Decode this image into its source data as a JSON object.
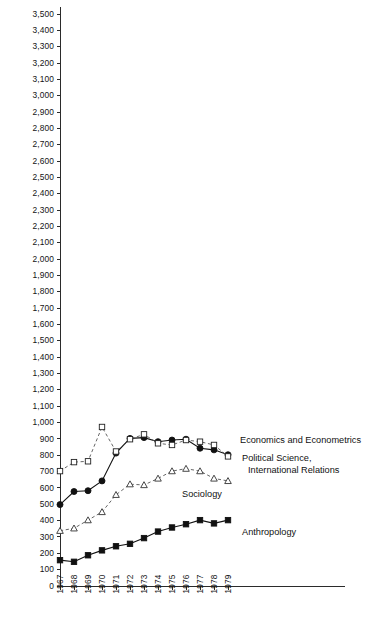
{
  "chart_data": {
    "type": "line",
    "title": "",
    "subtitle": "",
    "xlabel": "",
    "ylabel": "",
    "grid": false,
    "legend_position": "inline-right-annotations",
    "x": [
      1967,
      1968,
      1969,
      1970,
      1971,
      1972,
      1973,
      1974,
      1975,
      1976,
      1977,
      1978,
      1979
    ],
    "xlim": [
      1967,
      1979
    ],
    "ylim": [
      0,
      3500
    ],
    "ytick_labels": [
      "3,500",
      "3,400",
      "3,300",
      "3,200",
      "3,100",
      "3,000",
      "2,900",
      "2,800",
      "2,700",
      "2,600",
      "2,500",
      "2,400",
      "2,300",
      "2,200",
      "2,100",
      "2,000",
      "1,900",
      "1,800",
      "1,700",
      "1,600",
      "1,500",
      "1,400",
      "1,300",
      "1,200",
      "1,100",
      "1,000",
      "900",
      "800",
      "700",
      "600",
      "500",
      "400",
      "300",
      "200",
      "100",
      "0"
    ],
    "ytick_values": [
      3500,
      3400,
      3300,
      3200,
      3100,
      3000,
      2900,
      2800,
      2700,
      2600,
      2500,
      2400,
      2300,
      2200,
      2100,
      2000,
      1900,
      1800,
      1700,
      1600,
      1500,
      1400,
      1300,
      1200,
      1100,
      1000,
      900,
      800,
      700,
      600,
      500,
      400,
      300,
      200,
      100,
      0
    ],
    "xtick_labels": [
      "1967",
      "1968",
      "1969",
      "1970",
      "1971",
      "1972",
      "1973",
      "1974",
      "1975",
      "1976",
      "1977",
      "1978",
      "1979"
    ],
    "series": [
      {
        "name": "Economics and Econometrics",
        "marker": "filled-circle",
        "line": "solid",
        "values": [
          495,
          575,
          580,
          640,
          810,
          900,
          905,
          880,
          890,
          895,
          840,
          830,
          800
        ]
      },
      {
        "name": "Political Science, International Relations",
        "marker": "open-square",
        "line": "dashed",
        "values": [
          700,
          755,
          760,
          970,
          820,
          895,
          925,
          870,
          860,
          890,
          880,
          860,
          790
        ]
      },
      {
        "name": "Sociology",
        "marker": "open-triangle",
        "line": "dashed",
        "values": [
          335,
          350,
          400,
          450,
          555,
          620,
          615,
          655,
          700,
          715,
          700,
          655,
          640
        ]
      },
      {
        "name": "Anthropology",
        "marker": "filled-square",
        "line": "solid",
        "values": [
          155,
          145,
          185,
          215,
          240,
          255,
          290,
          330,
          355,
          375,
          400,
          380,
          400
        ]
      }
    ],
    "annotations": [
      {
        "text": "Economics and Econometrics",
        "series": "Economics and Econometrics"
      },
      {
        "text": "Political Science,",
        "series": "Political Science, International Relations"
      },
      {
        "text": "International Relations",
        "series": "Political Science, International Relations"
      },
      {
        "text": "Sociology",
        "series": "Sociology"
      },
      {
        "text": "Anthropology",
        "series": "Anthropology"
      }
    ],
    "colors": {
      "axis": "#2b2b2b",
      "solid_line": "#111111",
      "dashed_line": "#555555",
      "text": "#141414",
      "background": "#ffffff"
    }
  }
}
